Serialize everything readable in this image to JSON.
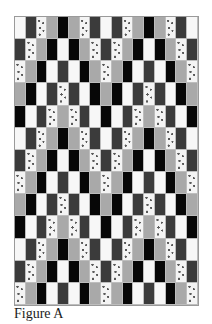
{
  "figure": {
    "caption": "Figure A",
    "columns": 17,
    "rows": 13,
    "legend": {
      "W": {
        "name": "white",
        "color": "#f7f7f7"
      },
      "D": {
        "name": "dark-gray",
        "color": "#3b3b3b"
      },
      "S": {
        "name": "speckled",
        "color": "#f4f4f4"
      },
      "G": {
        "name": "gray",
        "color": "#a9a9a9"
      },
      "K": {
        "name": "black",
        "color": "#070707"
      }
    },
    "grid": [
      [
        "W",
        "D",
        "S",
        "G",
        "K",
        "G",
        "S",
        "D",
        "W",
        "D",
        "S",
        "G",
        "K",
        "G",
        "S",
        "D",
        "W"
      ],
      [
        "D",
        "S",
        "G",
        "K",
        "W",
        "K",
        "G",
        "S",
        "D",
        "S",
        "G",
        "K",
        "W",
        "K",
        "G",
        "S",
        "D"
      ],
      [
        "S",
        "G",
        "K",
        "W",
        "D",
        "W",
        "K",
        "G",
        "S",
        "G",
        "K",
        "W",
        "D",
        "W",
        "K",
        "G",
        "S"
      ],
      [
        "G",
        "K",
        "W",
        "D",
        "S",
        "D",
        "W",
        "K",
        "G",
        "K",
        "W",
        "D",
        "S",
        "D",
        "W",
        "K",
        "G"
      ],
      [
        "K",
        "W",
        "D",
        "S",
        "G",
        "S",
        "D",
        "W",
        "K",
        "W",
        "D",
        "S",
        "G",
        "S",
        "D",
        "W",
        "K"
      ],
      [
        "W",
        "D",
        "S",
        "G",
        "K",
        "G",
        "S",
        "D",
        "W",
        "D",
        "S",
        "G",
        "K",
        "G",
        "S",
        "D",
        "W"
      ],
      [
        "D",
        "S",
        "G",
        "K",
        "W",
        "K",
        "G",
        "S",
        "D",
        "S",
        "G",
        "K",
        "W",
        "K",
        "G",
        "S",
        "D"
      ],
      [
        "S",
        "G",
        "K",
        "W",
        "D",
        "W",
        "K",
        "G",
        "S",
        "G",
        "K",
        "W",
        "D",
        "W",
        "K",
        "G",
        "S"
      ],
      [
        "G",
        "K",
        "W",
        "D",
        "S",
        "D",
        "W",
        "K",
        "G",
        "K",
        "W",
        "D",
        "S",
        "D",
        "W",
        "K",
        "G"
      ],
      [
        "K",
        "W",
        "D",
        "S",
        "G",
        "S",
        "D",
        "W",
        "K",
        "W",
        "D",
        "S",
        "G",
        "S",
        "D",
        "W",
        "K"
      ],
      [
        "W",
        "D",
        "S",
        "G",
        "K",
        "G",
        "S",
        "D",
        "W",
        "D",
        "S",
        "G",
        "K",
        "G",
        "S",
        "D",
        "W"
      ],
      [
        "D",
        "S",
        "G",
        "K",
        "W",
        "K",
        "G",
        "S",
        "D",
        "S",
        "G",
        "K",
        "W",
        "K",
        "G",
        "S",
        "D"
      ],
      [
        "S",
        "G",
        "K",
        "W",
        "D",
        "W",
        "K",
        "G",
        "S",
        "G",
        "K",
        "W",
        "D",
        "W",
        "K",
        "G",
        "S"
      ]
    ]
  }
}
